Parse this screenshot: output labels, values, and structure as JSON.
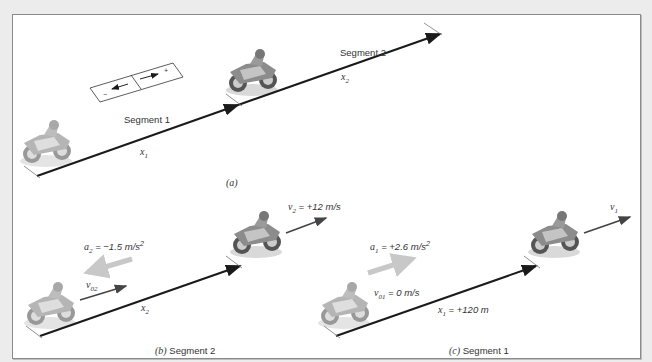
{
  "figure": {
    "background_color": "#ececec",
    "panel_color": "#ffffff",
    "border_color": "#8a8a8a",
    "arrow_color": "#1a1a1a",
    "velocity_arrow_color": "#444444",
    "accel_arrow_color": "#c8c8c8"
  },
  "part_a": {
    "caption": "(a)",
    "segment1_label": "Segment 1",
    "segment2_label": "Segment 2",
    "x1_label": "x",
    "x1_sub": "1",
    "x2_label": "x",
    "x2_sub": "2",
    "sign_box": {
      "minus": "−",
      "plus": "+"
    }
  },
  "part_b": {
    "caption_letter": "(b)",
    "caption_text": " Segment 2",
    "accel": {
      "sym": "a",
      "sub": "2",
      "value": " = −1.5 m/s",
      "sup": "2"
    },
    "v0": {
      "sym": "v",
      "sub": "02"
    },
    "v_final": {
      "sym": "v",
      "sub": "2",
      "value": " = +12 m/s"
    },
    "displacement": {
      "sym": "x",
      "sub": "2"
    }
  },
  "part_c": {
    "caption_letter": "(c)",
    "caption_text": " Segment 1",
    "accel": {
      "sym": "a",
      "sub": "1",
      "value": " = +2.6 m/s",
      "sup": "2"
    },
    "v0": {
      "sym": "v",
      "sub": "01",
      "value": " = 0 m/s"
    },
    "v_final": {
      "sym": "v",
      "sub": "1"
    },
    "displacement": {
      "sym": "x",
      "sub": "1",
      "value": " = +120 m"
    }
  }
}
